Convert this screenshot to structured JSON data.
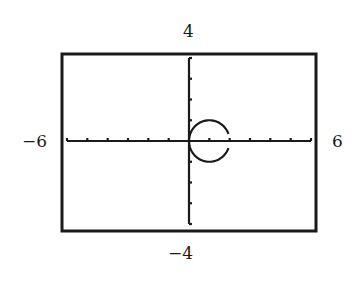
{
  "chart_data": {
    "type": "line",
    "title": "",
    "xlabel": "",
    "ylabel": "",
    "xlim": [
      -6,
      6
    ],
    "ylim": [
      -4,
      4
    ],
    "xscale": 1,
    "yscale": 1,
    "grid": false,
    "window_labels": {
      "ymax": "4",
      "ymin": "-4",
      "xmin": "-6",
      "xmax": "6"
    },
    "series": [
      {
        "name": "circle",
        "description": "Circle centered at (1, 0) with radius 1, plotted with a small gap at the point (2, 0)",
        "center": [
          1,
          0
        ],
        "radius": 1,
        "gap_at": [
          2,
          0
        ]
      }
    ]
  }
}
